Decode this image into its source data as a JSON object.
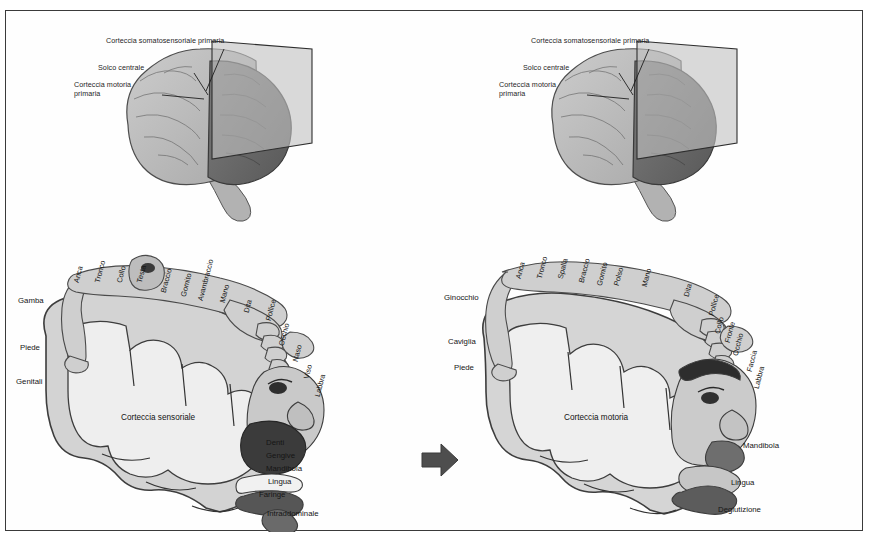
{
  "figure": {
    "border_color": "#3a3a3a",
    "background": "#ffffff",
    "arrow_color": "#4a4a4a",
    "cortex_fill": "#cfcfcf",
    "cortex_inner": "#e8e8e8",
    "brain_fill": "#bdbdbd",
    "brain_dark": "#6e6e6e",
    "plane_fill": "#c8c8c8"
  },
  "brain_diagram": {
    "labels": {
      "somatosensory": "Corteccia somatosensoriale primaria",
      "central_sulcus": "Solco centrale",
      "motor": "Corteccia motoria primaria"
    }
  },
  "left_panel": {
    "area_label": "Corteccia sensoriale",
    "top_labels": [
      {
        "text": "Anca",
        "x": 70,
        "y": 62
      },
      {
        "text": "Tronco",
        "x": 91,
        "y": 62
      },
      {
        "text": "Collo",
        "x": 113,
        "y": 62
      },
      {
        "text": "Testa",
        "x": 133,
        "y": 62
      },
      {
        "text": "Braccio",
        "x": 157,
        "y": 72
      },
      {
        "text": "Gomito",
        "x": 177,
        "y": 76
      },
      {
        "text": "Avambraccio",
        "x": 194,
        "y": 80
      },
      {
        "text": "Mano",
        "x": 216,
        "y": 82
      },
      {
        "text": "Dita",
        "x": 240,
        "y": 92
      },
      {
        "text": "Pollice",
        "x": 262,
        "y": 100
      }
    ],
    "left_labels": [
      {
        "text": "Gamba",
        "x": 12,
        "y": 80
      },
      {
        "text": "Piede",
        "x": 14,
        "y": 127
      },
      {
        "text": "Genitali",
        "x": 10,
        "y": 161
      }
    ],
    "right_labels": [
      {
        "text": "Occhio",
        "x": 275,
        "y": 125,
        "rot": true
      },
      {
        "text": "Naso",
        "x": 289,
        "y": 141,
        "rot": true
      },
      {
        "text": "Viso",
        "x": 300,
        "y": 158,
        "rot": true
      },
      {
        "text": "Labbra",
        "x": 311,
        "y": 176,
        "rot": true
      },
      {
        "text": "Denti",
        "x": 260,
        "y": 222,
        "rot": false
      },
      {
        "text": "Gengive",
        "x": 260,
        "y": 235,
        "rot": false
      },
      {
        "text": "Mandibola",
        "x": 260,
        "y": 248,
        "rot": false
      },
      {
        "text": "Lingua",
        "x": 262,
        "y": 261,
        "rot": false
      },
      {
        "text": "Faringe",
        "x": 253,
        "y": 274,
        "rot": false
      },
      {
        "text": "Intraddominale",
        "x": 261,
        "y": 293,
        "rot": false
      }
    ]
  },
  "right_panel": {
    "area_label": "Corteccia motoria",
    "top_labels": [
      {
        "text": "Anca",
        "x": 82,
        "y": 58
      },
      {
        "text": "Tronco",
        "x": 103,
        "y": 58
      },
      {
        "text": "Spalla",
        "x": 124,
        "y": 58
      },
      {
        "text": "Braccio",
        "x": 145,
        "y": 62
      },
      {
        "text": "Gomito",
        "x": 163,
        "y": 65
      },
      {
        "text": "Polso",
        "x": 180,
        "y": 65
      },
      {
        "text": "Mano",
        "x": 208,
        "y": 66
      },
      {
        "text": "Dita",
        "x": 250,
        "y": 76
      }
    ],
    "left_labels": [
      {
        "text": "Ginocchio",
        "x": 8,
        "y": 77
      },
      {
        "text": "Caviglia",
        "x": 12,
        "y": 121
      },
      {
        "text": "Piede",
        "x": 18,
        "y": 147
      }
    ],
    "right_labels": [
      {
        "text": "Pollice",
        "x": 275,
        "y": 95,
        "rot": true
      },
      {
        "text": "Collo",
        "x": 281,
        "y": 113,
        "rot": true
      },
      {
        "text": "Fronte",
        "x": 291,
        "y": 122,
        "rot": true
      },
      {
        "text": "Occhio",
        "x": 299,
        "y": 135,
        "rot": true
      },
      {
        "text": "Faccia",
        "x": 313,
        "y": 151,
        "rot": true
      },
      {
        "text": "Labbra",
        "x": 320,
        "y": 168,
        "rot": true
      },
      {
        "text": "Mandibola",
        "x": 307,
        "y": 225,
        "rot": false
      },
      {
        "text": "Lingua",
        "x": 295,
        "y": 262,
        "rot": false
      },
      {
        "text": "Deglutizione",
        "x": 282,
        "y": 289,
        "rot": false
      }
    ]
  }
}
